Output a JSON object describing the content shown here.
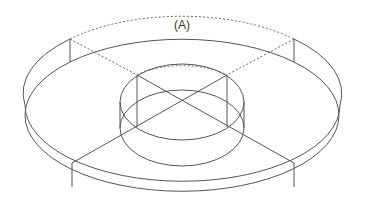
{
  "figure": {
    "label": "(A)",
    "line_color": "#555555",
    "background": "#ffffff"
  }
}
